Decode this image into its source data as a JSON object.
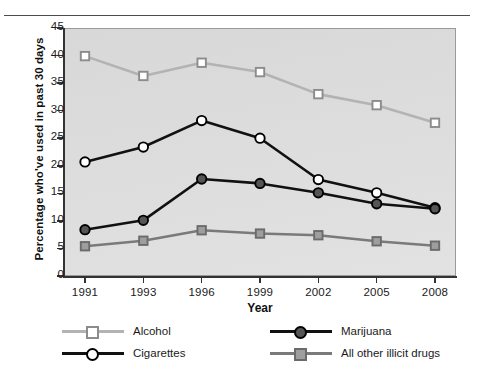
{
  "chart_data": {
    "type": "line",
    "title": "",
    "xlabel": "Year",
    "ylabel": "Percentage who've used in past 30 days",
    "x": [
      "1991",
      "1993",
      "1996",
      "1999",
      "2002",
      "2005",
      "2008"
    ],
    "categories": [
      "1991",
      "1993",
      "1996",
      "1999",
      "2002",
      "2005",
      "2008"
    ],
    "ylim": [
      0,
      45
    ],
    "yticks": [
      0,
      5,
      10,
      15,
      20,
      25,
      30,
      35,
      40,
      45
    ],
    "ytick_labels": [
      "0",
      "5",
      "10",
      "15",
      "20",
      "25",
      "30",
      "35",
      "40",
      "45"
    ],
    "grid": false,
    "legend_position": "bottom",
    "series": [
      {
        "name": "Alcohol",
        "values": [
          39.9,
          36.3,
          38.7,
          37.0,
          33.0,
          31.0,
          27.8
        ],
        "line_color": "#b3b3b3",
        "marker": "square",
        "marker_fill": "#ffffff",
        "marker_edge": "#8c8c8c"
      },
      {
        "name": "Cigarettes",
        "values": [
          20.7,
          23.4,
          28.2,
          25.0,
          17.5,
          15.1,
          12.4
        ],
        "line_color": "#111111",
        "marker": "circle",
        "marker_fill": "#ffffff",
        "marker_edge": "#000000"
      },
      {
        "name": "Marijuana",
        "values": [
          8.4,
          10.1,
          17.6,
          16.8,
          15.1,
          13.1,
          12.2
        ],
        "line_color": "#111111",
        "marker": "circle",
        "marker_fill": "#555555",
        "marker_edge": "#000000"
      },
      {
        "name": "All other illicit drugs",
        "values": [
          5.4,
          6.4,
          8.3,
          7.7,
          7.4,
          6.3,
          5.5
        ],
        "line_color": "#7a7a7a",
        "marker": "square",
        "marker_fill": "#9e9e9e",
        "marker_edge": "#6b6b6b"
      }
    ]
  },
  "axes": {
    "y_title": "Percentage who've used in past 30 days",
    "x_title": "Year"
  },
  "legend": {
    "entries": [
      {
        "label": "Alcohol",
        "line_color": "#b3b3b3",
        "marker": "square",
        "marker_fill": "#ffffff",
        "marker_edge": "#8c8c8c"
      },
      {
        "label": "Marijuana",
        "line_color": "#111111",
        "marker": "circle",
        "marker_fill": "#555555",
        "marker_edge": "#000000"
      },
      {
        "label": "Cigarettes",
        "line_color": "#111111",
        "marker": "circle",
        "marker_fill": "#ffffff",
        "marker_edge": "#000000"
      },
      {
        "label": "All other illicit drugs",
        "line_color": "#7a7a7a",
        "marker": "square",
        "marker_fill": "#9e9e9e",
        "marker_edge": "#6b6b6b"
      }
    ]
  },
  "colors": {
    "plot_background": "#dedede",
    "frame": "#9a9a9a",
    "axis": "#333333",
    "text": "#1a1a1a"
  }
}
